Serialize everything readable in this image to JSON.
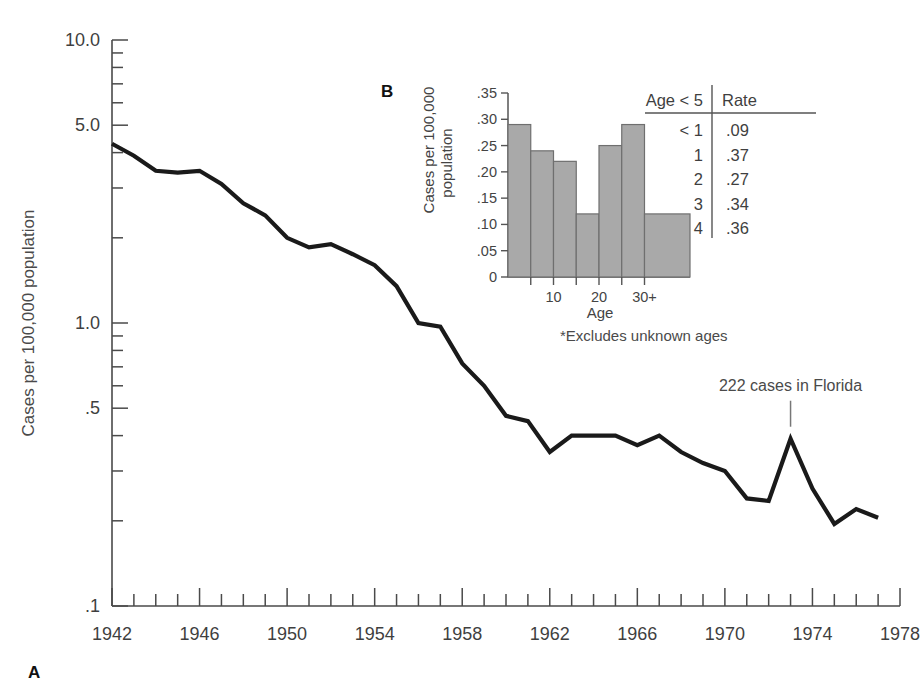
{
  "figure": {
    "panel_a_letter": "A",
    "panel_b_letter": "B"
  },
  "chart_data": [
    {
      "id": "panel-a",
      "type": "line",
      "title": "",
      "xlabel": "",
      "ylabel": "Cases per 100,000 population",
      "yscale": "log",
      "ylim": [
        0.1,
        10.0
      ],
      "xlim": [
        1942,
        1978
      ],
      "grid": false,
      "legend": "none",
      "ytick_labels": [
        "10.0",
        "5.0",
        "1.0",
        ".5",
        ".1"
      ],
      "ytick_values": [
        10.0,
        5.0,
        1.0,
        0.5,
        0.1
      ],
      "xtick_labels": [
        "1942",
        "1946",
        "1950",
        "1954",
        "1958",
        "1962",
        "1966",
        "1970",
        "1974",
        "1978"
      ],
      "xtick_values": [
        1942,
        1946,
        1950,
        1954,
        1958,
        1962,
        1966,
        1970,
        1974,
        1978
      ],
      "x": [
        1942,
        1943,
        1944,
        1945,
        1946,
        1947,
        1948,
        1949,
        1950,
        1951,
        1952,
        1953,
        1954,
        1955,
        1956,
        1957,
        1958,
        1959,
        1960,
        1961,
        1962,
        1963,
        1964,
        1965,
        1966,
        1967,
        1968,
        1969,
        1970,
        1971,
        1972,
        1973,
        1974,
        1975,
        1976,
        1977
      ],
      "values": [
        4.3,
        3.9,
        3.45,
        3.4,
        3.45,
        3.1,
        2.65,
        2.4,
        2.0,
        1.85,
        1.9,
        1.75,
        1.6,
        1.35,
        1.0,
        0.97,
        0.72,
        0.6,
        0.47,
        0.45,
        0.35,
        0.4,
        0.4,
        0.4,
        0.37,
        0.4,
        0.35,
        0.32,
        0.3,
        0.24,
        0.235,
        0.39,
        0.26,
        0.195,
        0.22,
        0.205
      ],
      "annotations": [
        {
          "text": "222 cases in Florida",
          "points_to_x": 1973,
          "points_to_y": 0.39
        }
      ]
    },
    {
      "id": "panel-b",
      "type": "bar",
      "title": "",
      "xlabel": "Age",
      "ylabel": "Cases per 100,000 population",
      "footnote": "*Excludes unknown ages",
      "ylim": [
        0,
        0.35
      ],
      "grid": false,
      "legend": "none",
      "ytick_labels": [
        "0",
        ".05",
        ".10",
        ".15",
        ".20",
        ".25",
        ".30",
        ".35"
      ],
      "ytick_values": [
        0,
        0.05,
        0.1,
        0.15,
        0.2,
        0.25,
        0.3,
        0.35
      ],
      "xtick_labels": [
        "10",
        "20",
        "30+"
      ],
      "xtick_values": [
        10,
        20,
        30
      ],
      "categories": [
        "0-4",
        "5-9",
        "10-14",
        "15-19",
        "20-24",
        "25-29",
        "30+"
      ],
      "bin_edges": [
        0,
        5,
        10,
        15,
        20,
        25,
        30,
        40
      ],
      "values": [
        0.29,
        0.24,
        0.22,
        0.12,
        0.25,
        0.29,
        0.12
      ],
      "bar_color": "#a9a9a9",
      "bar_edge_color": "#6f6f6f"
    },
    {
      "id": "panel-b-table",
      "type": "table",
      "columns": [
        "Age < 5",
        "Rate"
      ],
      "rows": [
        [
          "< 1",
          ".09"
        ],
        [
          "1",
          ".37"
        ],
        [
          "2",
          ".27"
        ],
        [
          "3",
          ".34"
        ],
        [
          "4",
          ".36"
        ]
      ]
    }
  ]
}
